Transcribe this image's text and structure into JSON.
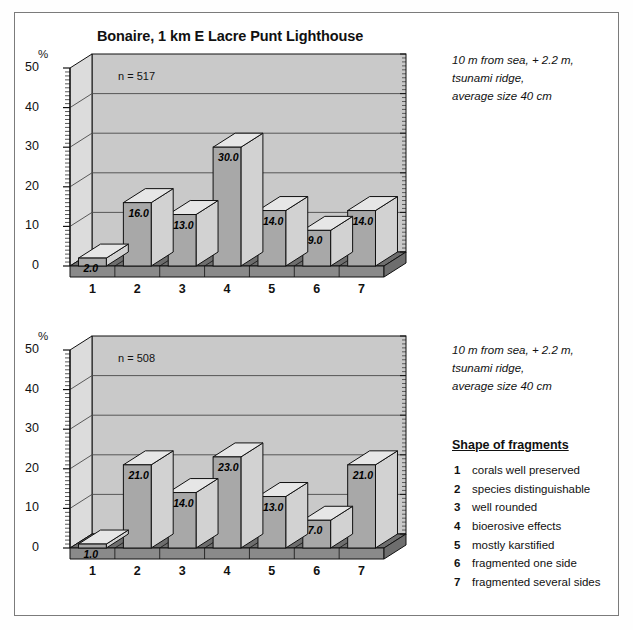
{
  "figure": {
    "title": "Bonaire, 1 km E Lacre Punt Lighthouse",
    "y_axis_unit": "%"
  },
  "notes": {
    "top": [
      "10 m from sea, + 2.2 m,",
      "tsunami ridge,",
      "average size 40 cm"
    ],
    "bottom": [
      "10 m from sea, + 2.2 m,",
      "tsunami ridge,",
      "average size 40 cm"
    ]
  },
  "legend": {
    "title": "Shape of fragments",
    "items": [
      {
        "num": "1",
        "label": "corals well preserved"
      },
      {
        "num": "2",
        "label": "species distinguishable"
      },
      {
        "num": "3",
        "label": "well rounded"
      },
      {
        "num": "4",
        "label": "bioerosive effects"
      },
      {
        "num": "5",
        "label": "mostly karstified"
      },
      {
        "num": "6",
        "label": "fragmented one side"
      },
      {
        "num": "7",
        "label": "fragmented several sides"
      }
    ]
  },
  "colors": {
    "bar_front": "#a8a8a8",
    "bar_top": "#e6e6e6",
    "bar_side": "#d2d2d2",
    "back_wall": "#c9c9c9",
    "left_wall": "#dcdcdc",
    "floor": "#6e6e6e",
    "floor_front": "#8a8a8a",
    "outline": "#111111",
    "gridline": "#4a4a4a"
  },
  "chart_data": [
    {
      "type": "bar",
      "id": "top",
      "title": "Bonaire, 1 km E Lacre Punt Lighthouse",
      "sample_label": "n = 517",
      "sample_size": 517,
      "categories": [
        "1",
        "2",
        "3",
        "4",
        "5",
        "6",
        "7"
      ],
      "values": [
        2.0,
        16.0,
        13.0,
        30.0,
        14.0,
        9.0,
        14.0
      ],
      "value_labels": [
        "2.0",
        "16.0",
        "13.0",
        "30.0",
        "14.0",
        "9.0",
        "14.0"
      ],
      "xlabel": "",
      "ylabel": "%",
      "ylim": [
        0,
        50
      ],
      "yticks": [
        0,
        10,
        20,
        30,
        40,
        50
      ],
      "ytick_labels": [
        "0",
        "10",
        "20",
        "30",
        "40",
        "50"
      ],
      "grid": true,
      "legend_position": "right",
      "annotations": [
        "10 m from sea, + 2.2 m,",
        "tsunami ridge,",
        "average size 40 cm"
      ]
    },
    {
      "type": "bar",
      "id": "bottom",
      "title": "",
      "sample_label": "n = 508",
      "sample_size": 508,
      "categories": [
        "1",
        "2",
        "3",
        "4",
        "5",
        "6",
        "7"
      ],
      "values": [
        1.0,
        21.0,
        14.0,
        23.0,
        13.0,
        7.0,
        21.0
      ],
      "value_labels": [
        "1.0",
        "21.0",
        "14.0",
        "23.0",
        "13.0",
        "7.0",
        "21.0"
      ],
      "xlabel": "",
      "ylabel": "%",
      "ylim": [
        0,
        50
      ],
      "yticks": [
        0,
        10,
        20,
        30,
        40,
        50
      ],
      "ytick_labels": [
        "0",
        "10",
        "20",
        "30",
        "40",
        "50"
      ],
      "grid": true,
      "legend_position": "right",
      "annotations": [
        "10 m from sea, + 2.2 m,",
        "tsunami ridge,",
        "average size 40 cm"
      ]
    }
  ]
}
